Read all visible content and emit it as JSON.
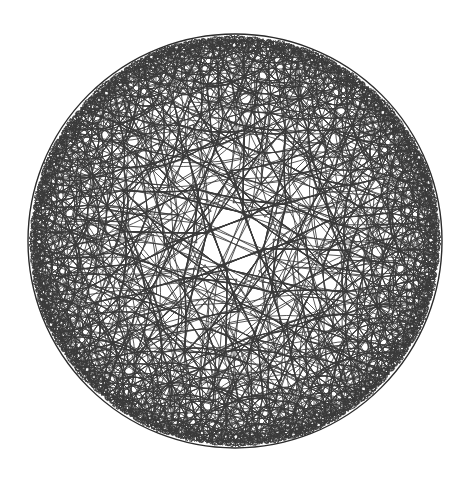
{
  "figure": {
    "title": "Poincare disk hyperbolic tessellation",
    "model": "Poincare disk",
    "background_color": "#ffffff",
    "line_color": "#3a3a3a",
    "boundary_color": "#2b2b2b",
    "line_width": 0.85,
    "boundary_width": 1.4
  },
  "chart_data": {
    "type": "diagram",
    "title": "Poincare disk hyperbolic tessellation",
    "subtitle": "",
    "xlabel": "",
    "ylabel": "",
    "grid": false,
    "legend": "none",
    "geometry": {
      "model": "poincare-disk",
      "center_x": 235,
      "center_y": 241,
      "radius": 207,
      "schlafli_p": 4,
      "schlafli_q": 5,
      "recursion_depth": 7,
      "seed_cell_vertices": 4,
      "vertex_degree": 4,
      "arcs_meet_boundary_orthogonally": true
    },
    "axis_ranges": {
      "xlim": [
        -1,
        1
      ],
      "ylim": [
        -1,
        1
      ]
    },
    "annotations": []
  },
  "canvas": {
    "width": 469,
    "height": 485
  }
}
